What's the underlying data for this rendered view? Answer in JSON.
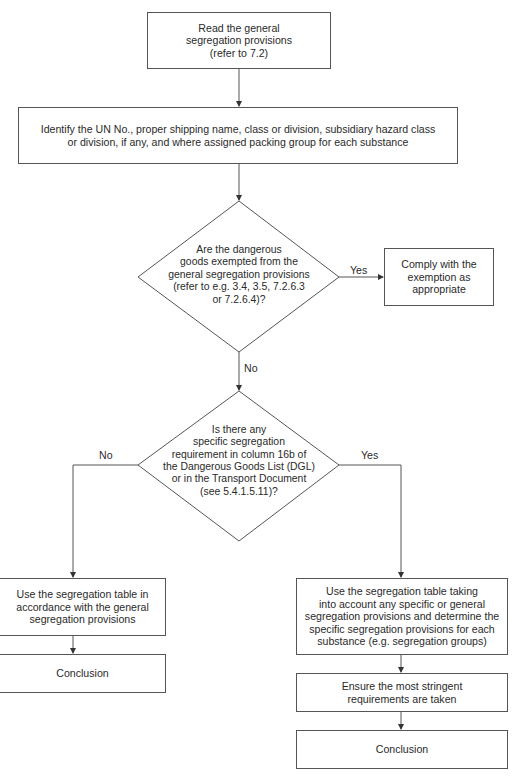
{
  "flowchart": {
    "nodes": {
      "start": {
        "type": "process",
        "text": "Read the general segregation provisions (refer to 7.2)"
      },
      "identify": {
        "type": "process",
        "text": "Identify the UN No., proper shipping name, class or division, subsidiary hazard class or division, if any, and where assigned packing group for each substance"
      },
      "decision_exempt": {
        "type": "decision",
        "text": "Are the dangerous goods exempted from the general segregation provisions (refer to e.g. 3.4, 3.5, 7.2.6.3 or 7.2.6.4)?"
      },
      "comply_exemption": {
        "type": "process",
        "text": "Comply with the exemption as appropriate"
      },
      "decision_specific": {
        "type": "decision",
        "text": "Is there any specific segregation requirement in column 16b of the Dangerous Goods List (DGL) or in the Transport Document (see 5.4.1.5.11)?"
      },
      "use_table_general": {
        "type": "process",
        "text": "Use the segregation table in accordance with the general segregation provisions"
      },
      "conclusion_left": {
        "type": "terminal",
        "text": "Conclusion"
      },
      "use_table_specific": {
        "type": "process",
        "text": "Use the segregation table taking into account any specific or general segregation provisions and determine the specific segregation provisions for each substance (e.g. segregation groups)"
      },
      "ensure_stringent": {
        "type": "process",
        "text": "Ensure the most stringent requirements are taken"
      },
      "conclusion_right": {
        "type": "terminal",
        "text": "Conclusion"
      }
    },
    "edges": [
      {
        "from": "start",
        "to": "identify",
        "label": ""
      },
      {
        "from": "identify",
        "to": "decision_exempt",
        "label": ""
      },
      {
        "from": "decision_exempt",
        "to": "comply_exemption",
        "label": "Yes"
      },
      {
        "from": "decision_exempt",
        "to": "decision_specific",
        "label": "No"
      },
      {
        "from": "decision_specific",
        "to": "use_table_general",
        "label": "No"
      },
      {
        "from": "decision_specific",
        "to": "use_table_specific",
        "label": "Yes"
      },
      {
        "from": "use_table_general",
        "to": "conclusion_left",
        "label": ""
      },
      {
        "from": "use_table_specific",
        "to": "ensure_stringent",
        "label": ""
      },
      {
        "from": "ensure_stringent",
        "to": "conclusion_right",
        "label": ""
      }
    ],
    "lines": {
      "start": [
        "Read the general",
        "segregation provisions",
        "(refer to 7.2)"
      ],
      "identify": [
        "Identify the UN No., proper shipping name, class or division, subsidiary hazard class",
        "or division, if any, and where assigned packing group for each substance"
      ],
      "decision_exempt": [
        "Are the dangerous",
        "goods exempted from the",
        "general segregation provisions",
        "(refer to e.g. 3.4, 3.5, 7.2.6.3",
        "or 7.2.6.4)?"
      ],
      "comply_exemption": [
        "Comply with the",
        "exemption as",
        "appropriate"
      ],
      "decision_specific": [
        "Is there any",
        "specific segregation",
        "requirement in column 16b of",
        "the Dangerous Goods List (DGL)",
        "or in the Transport Document",
        "(see 5.4.1.5.11)?"
      ],
      "use_table_general": [
        "Use the segregation table in",
        "accordance with the general",
        "segregation provisions"
      ],
      "conclusion_left": [
        "Conclusion"
      ],
      "use_table_specific": [
        "Use the segregation table taking",
        "into account any specific or general",
        "segregation provisions and determine the",
        "specific segregation provisions for each",
        "substance (e.g. segregation groups)"
      ],
      "ensure_stringent": [
        "Ensure the most stringent",
        "requirements are taken"
      ],
      "conclusion_right": [
        "Conclusion"
      ]
    },
    "labels": {
      "exempt_yes": "Yes",
      "exempt_no": "No",
      "specific_no": "No",
      "specific_yes": "Yes"
    },
    "colors": {
      "line": "#555555",
      "text": "#2a2a2a",
      "background": "#ffffff"
    }
  }
}
